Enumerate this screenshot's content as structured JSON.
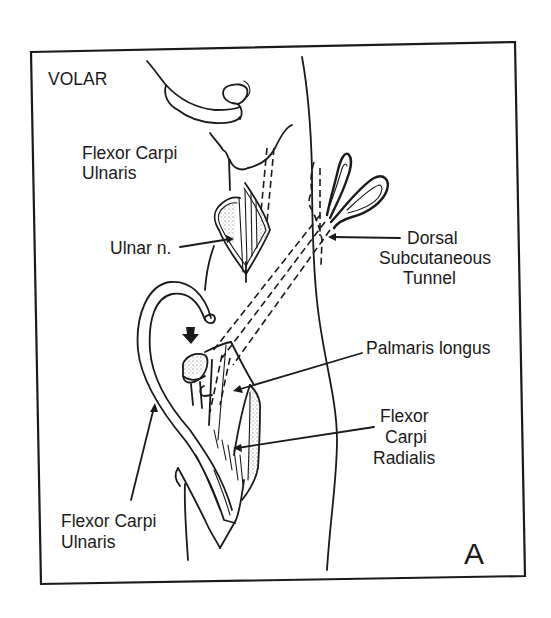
{
  "figure": {
    "view_label": "VOLAR",
    "panel_letter": "A",
    "colors": {
      "ink": "#1a1a1a",
      "background": "#ffffff"
    }
  },
  "labels": {
    "fcu_top_line1": "Flexor Carpi",
    "fcu_top_line2": "Ulnaris",
    "ulnar_nerve": "Ulnar n.",
    "dorsal_line1": "Dorsal",
    "dorsal_line2": "Subcutaneous",
    "dorsal_line3": "Tunnel",
    "palmaris_longus": "Palmaris longus",
    "fcr_line1": "Flexor",
    "fcr_line2": "Carpi",
    "fcr_line3": "Radialis",
    "fcu_bottom_line1": "Flexor Carpi",
    "fcu_bottom_line2": "Ulnaris"
  },
  "icons": [
    "scissors-icon",
    "down-arrow-icon"
  ]
}
